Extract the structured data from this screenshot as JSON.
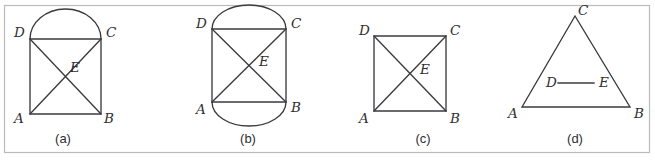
{
  "panel": {
    "width": 655,
    "height": 161,
    "background_color": "#ffffff",
    "border_color": "#b9bbbd",
    "frame": {
      "x": 4,
      "y": 5,
      "width": 646,
      "height": 148
    }
  },
  "style": {
    "stroke_color": "#3b3b3f",
    "stroke_width": 1.35,
    "label_color": "#2e2e31"
  },
  "figures": [
    {
      "id": "figure-a",
      "caption": "(a)",
      "caption_pos": {
        "x": 63,
        "y": 140
      },
      "description": "square ABCD with diagonals meeting at E and a semicircular arc on side DC",
      "shape": {
        "type": "square-with-top-arc",
        "left": 30,
        "right": 101,
        "top": 39,
        "bottom": 114
      },
      "arc": {
        "cx": 65.5,
        "cy": 39,
        "rx": 35.5,
        "ry": 30,
        "side": "top"
      },
      "vertices": [
        {
          "name": "A",
          "x": 30,
          "y": 114,
          "label_x": 14,
          "label_y": 119
        },
        {
          "name": "B",
          "x": 101,
          "y": 114,
          "label_x": 104,
          "label_y": 119
        },
        {
          "name": "C",
          "x": 101,
          "y": 39,
          "label_x": 106,
          "label_y": 33
        },
        {
          "name": "D",
          "x": 30,
          "y": 39,
          "label_x": 14,
          "label_y": 33
        },
        {
          "name": "E",
          "x": 65.5,
          "y": 76.5,
          "label_x": 70,
          "label_y": 68
        }
      ]
    },
    {
      "id": "figure-b",
      "caption": "(b)",
      "caption_pos": {
        "x": 248,
        "y": 140
      },
      "description": "rectangle ABCD with diagonals meeting at E and semicircular arcs on sides DC and AB",
      "shape": {
        "type": "rectangle-with-top-and-bottom-arcs",
        "left": 212,
        "right": 286,
        "top": 29,
        "bottom": 102
      },
      "arc_top": {
        "cx": 249,
        "cy": 29,
        "rx": 37,
        "ry": 24,
        "side": "top"
      },
      "arc_bottom": {
        "cx": 249,
        "cy": 102,
        "rx": 37,
        "ry": 24,
        "side": "bottom"
      },
      "vertices": [
        {
          "name": "A",
          "x": 212,
          "y": 102,
          "label_x": 196,
          "label_y": 110
        },
        {
          "name": "B",
          "x": 286,
          "y": 102,
          "label_x": 291,
          "label_y": 108
        },
        {
          "name": "C",
          "x": 286,
          "y": 29,
          "label_x": 291,
          "label_y": 24
        },
        {
          "name": "D",
          "x": 212,
          "y": 29,
          "label_x": 196,
          "label_y": 24
        },
        {
          "name": "E",
          "x": 249,
          "y": 65.5,
          "label_x": 259,
          "label_y": 62
        }
      ]
    },
    {
      "id": "figure-c",
      "caption": "(c)",
      "caption_pos": {
        "x": 423,
        "y": 140
      },
      "description": "square ABCD with diagonals meeting at E",
      "shape": {
        "type": "square",
        "left": 374,
        "right": 446,
        "top": 36,
        "bottom": 111
      },
      "vertices": [
        {
          "name": "A",
          "x": 374,
          "y": 111,
          "label_x": 359,
          "label_y": 119
        },
        {
          "name": "B",
          "x": 446,
          "y": 111,
          "label_x": 450,
          "label_y": 119
        },
        {
          "name": "C",
          "x": 446,
          "y": 36,
          "label_x": 450,
          "label_y": 31
        },
        {
          "name": "D",
          "x": 374,
          "y": 36,
          "label_x": 359,
          "label_y": 31
        },
        {
          "name": "E",
          "x": 410,
          "y": 73.5,
          "label_x": 420,
          "label_y": 70
        }
      ]
    },
    {
      "id": "figure-d",
      "caption": "(d)",
      "caption_pos": {
        "x": 575,
        "y": 140
      },
      "description": "triangle ABC with apex C and horizontal segment DE inside",
      "shape": {
        "type": "triangle-with-midsegment",
        "apex_x": 575,
        "apex_y": 16,
        "left_x": 522,
        "right_x": 630,
        "base_y": 107
      },
      "segment": {
        "x1": 558,
        "y1": 83,
        "x2": 594,
        "y2": 83
      },
      "vertices": [
        {
          "name": "A",
          "x": 522,
          "y": 107,
          "label_x": 508,
          "label_y": 114
        },
        {
          "name": "B",
          "x": 630,
          "y": 107,
          "label_x": 634,
          "label_y": 114
        },
        {
          "name": "C",
          "x": 575,
          "y": 16,
          "label_x": 578,
          "label_y": 11
        },
        {
          "name": "D",
          "x": 558,
          "y": 83,
          "label_x": 546,
          "label_y": 83
        },
        {
          "name": "E",
          "x": 594,
          "y": 83,
          "label_x": 599,
          "label_y": 83
        }
      ]
    }
  ]
}
